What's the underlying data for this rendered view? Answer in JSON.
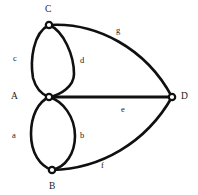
{
  "figure": {
    "kind": "undirected-multigraph-diagram",
    "background_color": "#ffffff",
    "stroke_color": "#101010",
    "label_color": "#1a1a1a",
    "width": 198,
    "height": 195
  },
  "vertices": [
    {
      "id": "C",
      "label": "C",
      "cx": 49,
      "cy": 25,
      "r": 3.2,
      "label_x": 45,
      "label_y": 5
    },
    {
      "id": "A",
      "label": "A",
      "cx": 49,
      "cy": 97,
      "r": 3.2,
      "label_x": 11,
      "label_y": 92
    },
    {
      "id": "B",
      "label": "B",
      "cx": 52,
      "cy": 170,
      "r": 3.2,
      "label_x": 49,
      "label_y": 182
    },
    {
      "id": "D",
      "label": "D",
      "cx": 172,
      "cy": 97,
      "r": 3.2,
      "label_x": 181,
      "label_y": 92
    }
  ],
  "edges": [
    {
      "id": "c",
      "label": "c",
      "from": "A",
      "to": "C",
      "shape": "arc-left",
      "label_x": 13,
      "label_y": 54
    },
    {
      "id": "d",
      "label": "d",
      "from": "A",
      "to": "C",
      "shape": "arc-right",
      "label_x": 80,
      "label_y": 56
    },
    {
      "id": "g",
      "label": "g",
      "from": "C",
      "to": "D",
      "shape": "arc-outer-top",
      "label_x": 116,
      "label_y": 26
    },
    {
      "id": "a",
      "label": "a",
      "from": "A",
      "to": "B",
      "shape": "arc-left",
      "label_x": 12,
      "label_y": 131
    },
    {
      "id": "b",
      "label": "b",
      "from": "A",
      "to": "B",
      "shape": "arc-right",
      "label_x": 80,
      "label_y": 131
    },
    {
      "id": "e",
      "label": "e",
      "from": "A",
      "to": "D",
      "shape": "straight",
      "label_x": 121,
      "label_y": 105
    },
    {
      "id": "f",
      "label": "f",
      "from": "B",
      "to": "D",
      "shape": "arc-outer-bottom",
      "label_x": 101,
      "label_y": 161
    }
  ]
}
